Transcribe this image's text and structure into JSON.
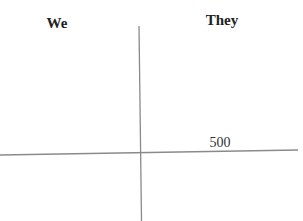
{
  "scoresheet": {
    "columns": [
      {
        "label": "We",
        "above_line": [],
        "below_line": []
      },
      {
        "label": "They",
        "above_line": [],
        "below_line": []
      }
    ],
    "scores": {
      "they_above_line": [
        "500"
      ]
    }
  },
  "colors": {
    "line": "#8a8a8a",
    "text": "#222222",
    "background": "#ffffff"
  }
}
